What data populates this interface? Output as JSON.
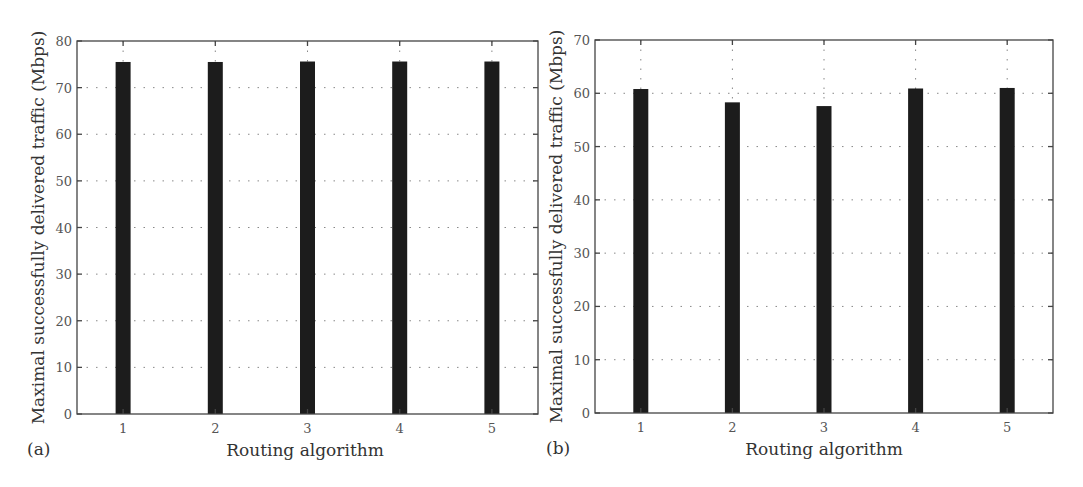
{
  "figure": {
    "colors": {
      "bar": "#1c1c1c",
      "axes": "#444444",
      "grid": "#888888",
      "tick_text": "#555555",
      "title_text": "#333333"
    }
  },
  "chart_data": [
    {
      "panel_label": "(a)",
      "type": "bar",
      "title": "",
      "xlabel": "Routing algorithm",
      "ylabel": "Maximal successfully delivered traffic (Mbps)",
      "categories": [
        "1",
        "2",
        "3",
        "4",
        "5"
      ],
      "values": [
        75.5,
        75.5,
        75.6,
        75.6,
        75.6
      ],
      "ylim": [
        0,
        80
      ],
      "yticks": [
        0,
        10,
        20,
        30,
        40,
        50,
        60,
        70,
        80
      ],
      "grid": true,
      "legend": null,
      "plot_box": {
        "x0": 77,
        "y0": 41,
        "x1": 538,
        "y1": 414
      },
      "xlabel_pos": {
        "x": 305,
        "y": 456
      },
      "panel_label_pos": {
        "x": 27,
        "y": 455
      }
    },
    {
      "panel_label": "(b)",
      "type": "bar",
      "title": "",
      "xlabel": "Routing algorithm",
      "ylabel": "Maximal successfully delivered traffic (Mbps)",
      "categories": [
        "1",
        "2",
        "3",
        "4",
        "5"
      ],
      "values": [
        60.8,
        58.3,
        57.6,
        60.9,
        61.0
      ],
      "ylim": [
        0,
        70
      ],
      "yticks": [
        0,
        10,
        20,
        30,
        40,
        50,
        60,
        70
      ],
      "grid": true,
      "legend": null,
      "plot_box": {
        "x0": 595,
        "y0": 40,
        "x1": 1053,
        "y1": 413
      },
      "xlabel_pos": {
        "x": 824,
        "y": 455
      },
      "panel_label_pos": {
        "x": 546,
        "y": 454
      }
    }
  ]
}
